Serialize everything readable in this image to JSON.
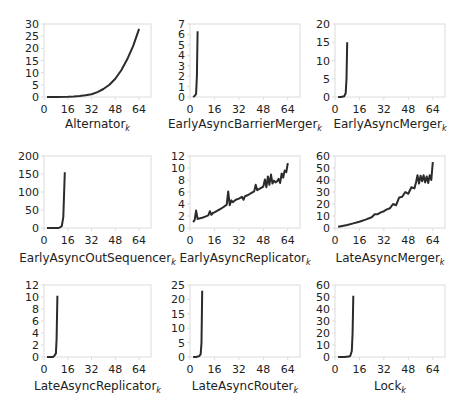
{
  "figure": {
    "layout": {
      "rows": 3,
      "cols": 3
    },
    "line_color": "#2b2b2b",
    "frame_color": "#dcdcdc"
  },
  "chart_data": [
    {
      "type": "line",
      "title": "",
      "xlabel": "Alternator",
      "xlabel_subscript": "k",
      "ylabel": "",
      "xlim": [
        0,
        72
      ],
      "ylim": [
        0,
        30
      ],
      "xticks": [
        0,
        16,
        32,
        48,
        64
      ],
      "yticks": [
        0,
        5,
        10,
        15,
        20,
        25,
        30
      ],
      "grid": false,
      "x": [
        2,
        8,
        16,
        20,
        24,
        28,
        32,
        36,
        40,
        44,
        48,
        52,
        56,
        60,
        64
      ],
      "y": [
        0,
        0,
        0.1,
        0.2,
        0.4,
        0.7,
        1.1,
        2,
        3.3,
        5,
        7.5,
        11,
        15.5,
        21,
        28
      ]
    },
    {
      "type": "line",
      "title": "",
      "xlabel": "EarlyAsyncBarrierMerger",
      "xlabel_subscript": "k",
      "ylabel": "",
      "xlim": [
        0,
        72
      ],
      "ylim": [
        0,
        7
      ],
      "xticks": [
        0,
        16,
        32,
        48,
        64
      ],
      "yticks": [
        0,
        1,
        2,
        3,
        4,
        5,
        6,
        7
      ],
      "grid": false,
      "x": [
        2,
        3,
        4,
        4.5,
        5
      ],
      "y": [
        0,
        0.1,
        0.3,
        2,
        6.3
      ]
    },
    {
      "type": "line",
      "title": "",
      "xlabel": "EarlyAsyncMerger",
      "xlabel_subscript": "k",
      "ylabel": "",
      "xlim": [
        0,
        72
      ],
      "ylim": [
        0,
        20
      ],
      "xticks": [
        0,
        16,
        32,
        48,
        64
      ],
      "yticks": [
        0,
        5,
        10,
        15,
        20
      ],
      "grid": false,
      "x": [
        2,
        4,
        6,
        7,
        7.5,
        8
      ],
      "y": [
        0,
        0,
        0.2,
        1,
        5,
        15
      ]
    },
    {
      "type": "line",
      "title": "",
      "xlabel": "EarlyAsyncOutSequencer",
      "xlabel_subscript": "k",
      "ylabel": "",
      "xlim": [
        0,
        72
      ],
      "ylim": [
        0,
        200
      ],
      "xticks": [
        0,
        16,
        32,
        48,
        64
      ],
      "yticks": [
        0,
        50,
        100,
        150,
        200
      ],
      "grid": false,
      "x": [
        2,
        6,
        10,
        12,
        13,
        14
      ],
      "y": [
        0,
        0,
        0,
        5,
        30,
        155
      ]
    },
    {
      "type": "line",
      "title": "",
      "xlabel": "EarlyAsyncReplicator",
      "xlabel_subscript": "k",
      "ylabel": "",
      "xlim": [
        0,
        72
      ],
      "ylim": [
        0,
        12
      ],
      "xticks": [
        0,
        16,
        32,
        48,
        64
      ],
      "yticks": [
        0,
        2,
        4,
        6,
        8,
        10,
        12
      ],
      "grid": false,
      "x": [
        2,
        3,
        4,
        5,
        6,
        8,
        10,
        12,
        13,
        14,
        15,
        16,
        18,
        20,
        22,
        24,
        25,
        26,
        27,
        28,
        30,
        32,
        34,
        35,
        36,
        38,
        40,
        42,
        43,
        44,
        46,
        48,
        49,
        50,
        51,
        52,
        53,
        54,
        55,
        56,
        57,
        58,
        59,
        60,
        61,
        62,
        63,
        64
      ],
      "y": [
        1,
        1.3,
        2.9,
        1.5,
        1.6,
        1.7,
        1.9,
        2.1,
        2.8,
        2.2,
        2.5,
        2.6,
        2.9,
        3.2,
        3.5,
        3.9,
        6.1,
        3.8,
        4.6,
        4.3,
        4.7,
        4.9,
        5.2,
        4.7,
        5.3,
        5.5,
        5.8,
        6.1,
        7.2,
        6.3,
        6.6,
        6.9,
        8.1,
        6.8,
        8.6,
        7.2,
        8.9,
        7.4,
        7.9,
        7.6,
        7.8,
        8.2,
        7.5,
        9.1,
        8.4,
        9.6,
        9.3,
        10.8
      ]
    },
    {
      "type": "line",
      "title": "",
      "xlabel": "LateAsyncMerger",
      "xlabel_subscript": "k",
      "ylabel": "",
      "xlim": [
        0,
        72
      ],
      "ylim": [
        0,
        60
      ],
      "xticks": [
        0,
        16,
        32,
        48,
        64
      ],
      "yticks": [
        0,
        10,
        20,
        30,
        40,
        50,
        60
      ],
      "grid": false,
      "x": [
        2,
        4,
        8,
        12,
        16,
        20,
        24,
        26,
        28,
        30,
        32,
        34,
        36,
        38,
        40,
        42,
        44,
        46,
        48,
        50,
        52,
        53,
        54,
        55,
        56,
        57,
        58,
        59,
        60,
        61,
        62,
        63,
        64
      ],
      "y": [
        1,
        1.5,
        2.5,
        3.8,
        5.2,
        7,
        9,
        11.5,
        11.5,
        13,
        14,
        15.5,
        16.5,
        20,
        19,
        25.5,
        26,
        30,
        28.5,
        34,
        33,
        38,
        44,
        37,
        43.5,
        39,
        44,
        38,
        43,
        37.5,
        44,
        40,
        55
      ]
    },
    {
      "type": "line",
      "title": "",
      "xlabel": "LateAsyncReplicator",
      "xlabel_subscript": "k",
      "ylabel": "",
      "xlim": [
        0,
        72
      ],
      "ylim": [
        0,
        12
      ],
      "xticks": [
        0,
        16,
        32,
        48,
        64
      ],
      "yticks": [
        0,
        2,
        4,
        6,
        8,
        10,
        12
      ],
      "grid": false,
      "x": [
        2,
        4,
        6,
        7,
        8,
        8.5,
        9
      ],
      "y": [
        0,
        0,
        0,
        0.2,
        0.6,
        3,
        10.2
      ]
    },
    {
      "type": "line",
      "title": "",
      "xlabel": "LateAsyncRouter",
      "xlabel_subscript": "k",
      "ylabel": "",
      "xlim": [
        0,
        72
      ],
      "ylim": [
        0,
        25
      ],
      "xticks": [
        0,
        16,
        32,
        48,
        64
      ],
      "yticks": [
        0,
        5,
        10,
        15,
        20,
        25
      ],
      "grid": false,
      "x": [
        2,
        4,
        6,
        7,
        7.5,
        8
      ],
      "y": [
        0,
        0,
        0.3,
        1,
        5,
        23
      ]
    },
    {
      "type": "line",
      "title": "",
      "xlabel": "Lock",
      "xlabel_subscript": "k",
      "ylabel": "",
      "xlim": [
        0,
        72
      ],
      "ylim": [
        0,
        60
      ],
      "xticks": [
        0,
        16,
        32,
        48,
        64
      ],
      "yticks": [
        0,
        10,
        20,
        30,
        40,
        50,
        60
      ],
      "grid": false,
      "x": [
        2,
        6,
        9,
        10,
        11,
        11.5,
        12
      ],
      "y": [
        0,
        0,
        0.3,
        1,
        5,
        20,
        51
      ]
    }
  ]
}
